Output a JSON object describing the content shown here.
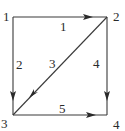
{
  "diagram": {
    "type": "directed-graph",
    "nodes": [
      {
        "id": "1",
        "label": "1",
        "x": 13,
        "y": 17,
        "label_x": 4,
        "label_y": 21
      },
      {
        "id": "2",
        "label": "2",
        "x": 107,
        "y": 17,
        "label_x": 113,
        "label_y": 21
      },
      {
        "id": "3",
        "label": "3",
        "x": 13,
        "y": 115,
        "label_x": 1,
        "label_y": 128
      },
      {
        "id": "4",
        "label": "4",
        "x": 107,
        "y": 115,
        "label_x": 113,
        "label_y": 129
      }
    ],
    "edges": [
      {
        "id": "e1",
        "from": "1",
        "to": "2",
        "label": "1",
        "label_x": 60,
        "label_y": 31
      },
      {
        "id": "e2",
        "from": "1",
        "to": "3",
        "label": "2",
        "label_x": 16,
        "label_y": 69
      },
      {
        "id": "e3",
        "from": "2",
        "to": "3",
        "label": "3",
        "label_x": 49,
        "label_y": 68
      },
      {
        "id": "e4",
        "from": "2",
        "to": "4",
        "label": "4",
        "label_x": 93,
        "label_y": 68
      },
      {
        "id": "e5",
        "from": "3",
        "to": "4",
        "label": "5",
        "label_x": 59,
        "label_y": 113
      }
    ],
    "colors": {
      "edge": "#3a3a3a",
      "text": "#2a2a2a",
      "background": "#ffffff"
    }
  }
}
